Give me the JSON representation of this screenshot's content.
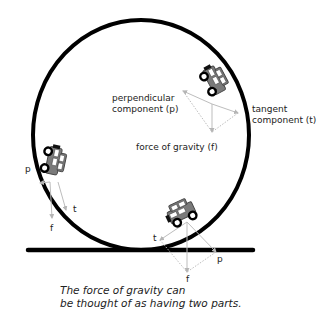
{
  "diagram": {
    "caption_lines": [
      "The force of gravity can",
      "be thought of as having two parts."
    ],
    "labels": {
      "perpendicular": [
        "perpendicular",
        "component (p)"
      ],
      "tangent": [
        "tangent",
        "component (t)"
      ],
      "gravity": "force of gravity (f)",
      "left_p": "p",
      "left_t": "t",
      "left_f": "f",
      "bottom_t": "t",
      "bottom_f": "f",
      "bottom_p": "p"
    },
    "colors": {
      "track": "#000000",
      "car_body": "#7a7a7a",
      "car_outline": "#444444",
      "wheel": "#000000",
      "vector": "#bdbdbd",
      "text": "#222222"
    },
    "cars": [
      {
        "position": "upper-right",
        "angle_deg": 60
      },
      {
        "position": "left",
        "angle_deg": 100
      },
      {
        "position": "bottom",
        "angle_deg": -25
      }
    ]
  }
}
